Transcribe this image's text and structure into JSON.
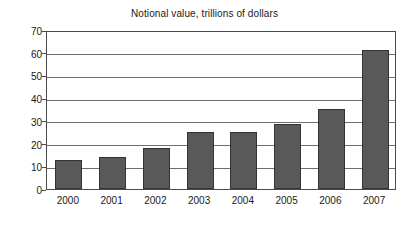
{
  "chart_data": {
    "type": "bar",
    "title": "Notional value, trillions of dollars",
    "xlabel": "",
    "ylabel": "",
    "categories": [
      "2000",
      "2001",
      "2002",
      "2003",
      "2004",
      "2005",
      "2006",
      "2007"
    ],
    "values": [
      12.8,
      14.2,
      18.0,
      25.0,
      25.2,
      28.6,
      35.3,
      61.2
    ],
    "ylim": [
      0,
      70
    ],
    "ytick_step": 10,
    "yticks": [
      "0",
      "10",
      "20",
      "30",
      "40",
      "50",
      "60",
      "70"
    ],
    "grid": "horizontal",
    "legend": "none",
    "bar_color": "#595959",
    "bar_border_color": "#333333",
    "gridline_color": "#6e6e6e",
    "frame_color": "#4a4a4a",
    "text_color": "#1a1a1a",
    "background_color": "#ffffff"
  }
}
